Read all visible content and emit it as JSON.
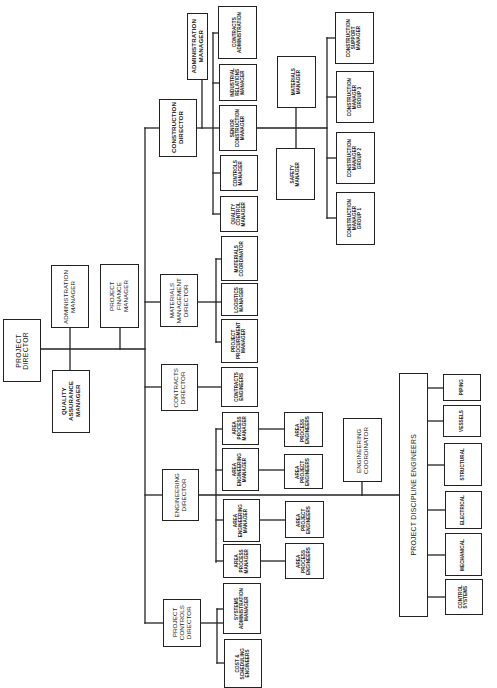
{
  "diagram": {
    "type": "organization-chart",
    "orientation": "rotated-90-ccw",
    "line_color": "#222222",
    "box_border_color": "#222222",
    "background": "#ffffff"
  },
  "nodes": {
    "project_director": {
      "label": "PROJECT\nDIRECTOR"
    },
    "administration_manager": {
      "label": "ADMINISTRATION\nMANAGER",
      "reports_to": "project_director"
    },
    "project_finance_manager": {
      "label": "PROJECT\nFINANCE\nMANAGER",
      "reports_to": "project_director"
    },
    "quality_assurance_manager": {
      "label": "QUALITY\nASSURANCE\nMANAGER",
      "reports_to": "project_director"
    },
    "construction_director": {
      "label": "CONSTRUCTION\nDIRECTOR",
      "reports_to": "project_director"
    },
    "construction_administration_manager": {
      "label": "ADMINISTRATION\nMANAGER",
      "reports_to": "construction_director"
    },
    "contracts_administration": {
      "label": "CONTRACTS\nADMINISTRATION",
      "reports_to": "construction_director"
    },
    "industrial_relations_manager": {
      "label": "INDUSTRIAL\nRELATIONS\nMANAGER",
      "reports_to": "construction_director"
    },
    "senior_construction_manager": {
      "label": "SENIOR\nCONSTRUCTION\nMANAGER",
      "reports_to": "construction_director"
    },
    "controls_manager": {
      "label": "CONTROLS\nMANAGER",
      "reports_to": "construction_director"
    },
    "quality_control_manager": {
      "label": "QUALITY\nCONTROL\nMANAGER",
      "reports_to": "construction_director"
    },
    "materials_manager": {
      "label": "MATERIALS\nMANAGER",
      "reports_to": "senior_construction_manager"
    },
    "safety_manager": {
      "label": "SAFETY\nMANAGER",
      "reports_to": "senior_construction_manager"
    },
    "construction_support_manager": {
      "label": "CONSTRUCTION\nSUPPORT\nMANAGER",
      "reports_to": "senior_construction_manager"
    },
    "construction_manager_group_3": {
      "label": "CONSTRUCTION\nMANAGER\nGROUP 3",
      "reports_to": "senior_construction_manager"
    },
    "construction_manager_group_2": {
      "label": "CONSTRUCTION\nMANAGER\nGROUP 2",
      "reports_to": "senior_construction_manager"
    },
    "construction_manager_group_1": {
      "label": "CONSTRUCTION\nMANAGER\nGROUP 1",
      "reports_to": "senior_construction_manager"
    },
    "materials_management_director": {
      "label": "MATERIALS\nMANAGEMENT\nDIRECTOR",
      "reports_to": "project_director"
    },
    "materials_coordinator": {
      "label": "MATERIALS\nCOORDINATOR",
      "reports_to": "materials_management_director"
    },
    "logistics_manager": {
      "label": "LOGISTICS\nMANAGER",
      "reports_to": "materials_management_director"
    },
    "project_procurement_manager": {
      "label": "PROJECT\nPROCUREMENT\nMANAGER",
      "reports_to": "materials_management_director"
    },
    "contracts_director": {
      "label": "CONTRACTS\nDIRECTOR",
      "reports_to": "project_director"
    },
    "contracts_engineers": {
      "label": "CONTRACTS\nENGINEERS",
      "reports_to": "contracts_director"
    },
    "engineering_director": {
      "label": "ENGINEERING\nDIRECTOR",
      "reports_to": "project_director"
    },
    "area_process_manager_1": {
      "label": "AREA\nPROCESS\nMANAGER",
      "reports_to": "engineering_director"
    },
    "area_engineering_manager_1": {
      "label": "AREA\nENGINEERING\nMANAGER",
      "reports_to": "engineering_director"
    },
    "area_engineering_manager_2": {
      "label": "AREA\nENGINEERING\nMANAGER",
      "reports_to": "engineering_director"
    },
    "area_process_manager_2": {
      "label": "AREA\nPROCESS\nMANAGER",
      "reports_to": "engineering_director"
    },
    "area_process_engineers_1": {
      "label": "AREA\nPROCESS\nENGINEERS",
      "reports_to": "area_process_manager_1"
    },
    "area_project_engineers_1": {
      "label": "AREA\nPROJECT\nENGINEERS",
      "reports_to": "area_engineering_manager_1"
    },
    "area_project_engineers_2": {
      "label": "AREA\nPROJECT\nENGINEERS",
      "reports_to": "area_engineering_manager_2"
    },
    "area_process_engineers_2": {
      "label": "AREA\nPROCESS\nENGINEERS",
      "reports_to": "area_process_manager_2"
    },
    "engineering_coordinator": {
      "label": "ENGINEERING\nCOORDINATOR",
      "reports_to": "engineering_director"
    },
    "project_discipline_engineers": {
      "label": "PROJECT DISCIPLINE ENGINEERS",
      "reports_to": "engineering_director"
    },
    "piping": {
      "label": "PIPING",
      "reports_to": "project_discipline_engineers"
    },
    "vessels": {
      "label": "VESSELS",
      "reports_to": "project_discipline_engineers"
    },
    "structural": {
      "label": "STRUCTURAL",
      "reports_to": "project_discipline_engineers"
    },
    "electrical": {
      "label": "ELECTRICAL",
      "reports_to": "project_discipline_engineers"
    },
    "mechanical": {
      "label": "MECHANICAL",
      "reports_to": "project_discipline_engineers"
    },
    "control_systems": {
      "label": "CONTROL\nSYSTEMS",
      "reports_to": "project_discipline_engineers"
    },
    "project_controls_director": {
      "label": "PROJECT\nCONTROLS\nDIRECTOR",
      "reports_to": "project_director"
    },
    "systems_administration_manager": {
      "label": "SYSTEMS\nADMINISTRATION\nMANAGER",
      "reports_to": "project_controls_director"
    },
    "cost_scheduling_engineers": {
      "label": "COST &\nSCHEDULING\nENGINEERS",
      "reports_to": "project_controls_director"
    }
  }
}
